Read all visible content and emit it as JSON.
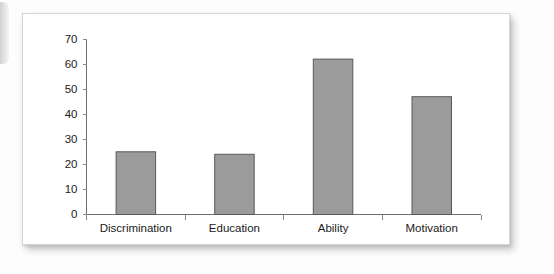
{
  "chart_data": {
    "type": "bar",
    "title": "",
    "subtitle": "",
    "xlabel": "",
    "ylabel": "",
    "categories": [
      "Discrimination",
      "Education",
      "Ability",
      "Motivation"
    ],
    "values": [
      25,
      24,
      62,
      47
    ],
    "series": [
      {
        "name": "",
        "values": [
          25,
          24,
          62,
          47
        ]
      }
    ],
    "ylim": [
      0,
      70
    ],
    "ytick_labels": [
      "0",
      "10",
      "20",
      "30",
      "40",
      "50",
      "60",
      "70"
    ],
    "ytick_values": [
      0,
      10,
      20,
      30,
      40,
      50,
      60,
      70
    ],
    "ytick_step": 10,
    "grid": false,
    "legend": false,
    "legend_position": "none",
    "orientation": "vertical",
    "annotations": [],
    "colors": {
      "bar_fill": "#9b9b9b",
      "bar_stroke": "#595959",
      "axis": "#6f6f6f",
      "tick": "#8a8a8a",
      "text": "#1b1b1b",
      "card_background": "#ffffff",
      "page_background": "#fdfdfd"
    }
  }
}
